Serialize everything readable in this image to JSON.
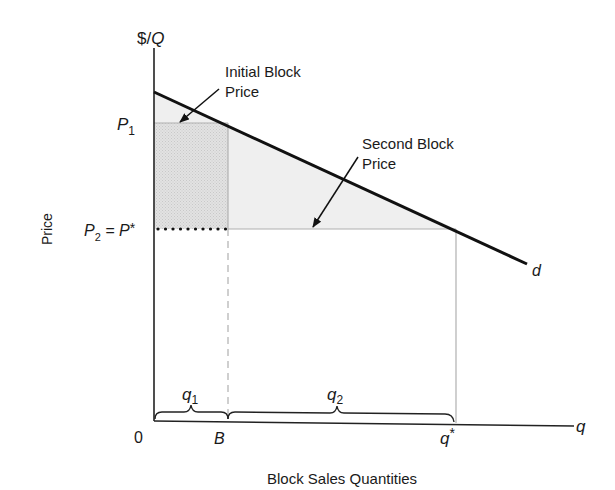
{
  "diagram": {
    "type": "block-pricing",
    "y_axis_label": "$/",
    "y_axis_label_q": "Q",
    "x_axis_label": "q",
    "side_label": "Price",
    "bottom_label": "Block Sales Quantities",
    "origin_label": "0",
    "ticks": {
      "p1": "P",
      "p1_sub": "1",
      "p2": "P",
      "p2_sub": "2",
      "p2_eq": " = P",
      "p2_star": "*",
      "b": "B",
      "qstar": "q",
      "qstar_sup": "*"
    },
    "braces": {
      "q1": "q",
      "q1_sub": "1",
      "q2": "q",
      "q2_sub": "2"
    },
    "annotations": {
      "initial_line1": "Initial Block",
      "initial_line2": "Price",
      "second_line1": "Second Block",
      "second_line2": "Price"
    },
    "curve_label": "d",
    "colors": {
      "line": "#111111",
      "initial_block_fill": "#dcdcdc",
      "surplus_fill": "#eeeeee",
      "guide": "#b5b5b5"
    }
  }
}
